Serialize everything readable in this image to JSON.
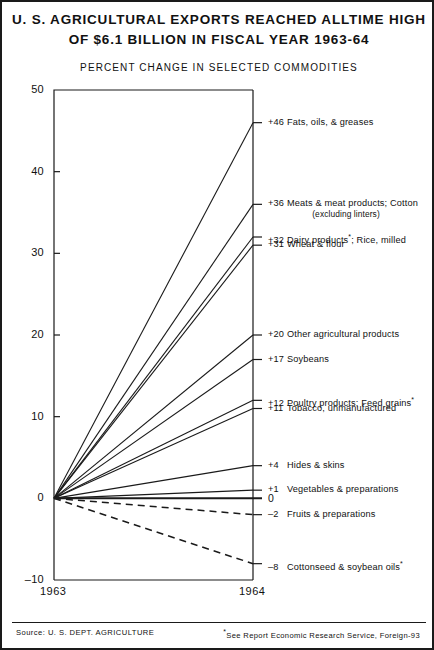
{
  "title": {
    "line1": "U. S. AGRICULTURAL EXPORTS REACHED ALLTIME HIGH",
    "line2": "OF $6.1 BILLION IN FISCAL YEAR 1963-64"
  },
  "subtitle": "PERCENT CHANGE IN SELECTED COMMODITIES",
  "footer": {
    "source": "Source: U. S. DEPT. AGRICULTURE",
    "note_star": "*",
    "note": "See Report Economic Research Service, Foreign-93"
  },
  "axis": {
    "y_ticks": [
      "50",
      "40",
      "30",
      "20",
      "10",
      "0",
      "-10"
    ],
    "x_ticks": [
      "1963",
      "1964"
    ],
    "zero_marker": "0"
  },
  "chart_data": {
    "type": "line",
    "title": "U. S. AGRICULTURAL EXPORTS REACHED ALLTIME HIGH OF $6.1 BILLION IN FISCAL YEAR 1963-64",
    "subtitle": "PERCENT CHANGE IN SELECTED COMMODITIES",
    "xlabel": "",
    "ylabel": "",
    "x": [
      "1963",
      "1964"
    ],
    "ylim": [
      -10,
      50
    ],
    "yticks": [
      -10,
      0,
      10,
      20,
      30,
      40,
      50
    ],
    "grid": false,
    "legend": "right-inline-labels",
    "series": [
      {
        "name": "Fats, oils, & greases",
        "value_label": "+46",
        "values": [
          0,
          46
        ],
        "style": "solid",
        "label": "Fats, oils, & greases",
        "footnote": false
      },
      {
        "name": "Meats & meat products; Cotton (excluding linters)",
        "value_label": "+36",
        "values": [
          0,
          36
        ],
        "style": "solid",
        "label": "Meats & meat products; Cotton",
        "sublabel": "(excluding linters)",
        "footnote": false
      },
      {
        "name": "Dairy products*; Rice, milled",
        "value_label": "+32",
        "values": [
          0,
          32
        ],
        "style": "solid",
        "label_pre": "Dairy products",
        "label_post": "; Rice, milled",
        "footnote": true
      },
      {
        "name": "Wheat & flour",
        "value_label": "+31",
        "values": [
          0,
          31
        ],
        "style": "solid",
        "label": "Wheat & flour",
        "footnote": false
      },
      {
        "name": "Other agricultural products",
        "value_label": "+20",
        "values": [
          0,
          20
        ],
        "style": "solid",
        "label": "Other agricultural products",
        "footnote": false
      },
      {
        "name": "Soybeans",
        "value_label": "+17",
        "values": [
          0,
          17
        ],
        "style": "solid",
        "label": "Soybeans",
        "footnote": false
      },
      {
        "name": "Poultry products; Feed grains*",
        "value_label": "+12",
        "values": [
          0,
          12
        ],
        "style": "solid",
        "label_pre": "Poultry products; Feed grains",
        "label_post": "",
        "footnote": true
      },
      {
        "name": "Tobacco, unmanufactured",
        "value_label": "+11",
        "values": [
          0,
          11
        ],
        "style": "solid",
        "label": "Tobacco, unmanufactured",
        "footnote": false
      },
      {
        "name": "Hides & skins",
        "value_label": "+4",
        "values": [
          0,
          4
        ],
        "style": "solid",
        "label": "Hides & skins",
        "footnote": false
      },
      {
        "name": "Vegetables & preparations",
        "value_label": "+1",
        "values": [
          0,
          1
        ],
        "style": "solid",
        "label": "Vegetables & preparations",
        "footnote": false
      },
      {
        "name": "Fruits & preparations",
        "value_label": "-2",
        "values": [
          0,
          -2
        ],
        "style": "dashed",
        "label": "Fruits & preparations",
        "footnote": false
      },
      {
        "name": "Cottonseed & soybean oils*",
        "value_label": "-8",
        "values": [
          0,
          -8
        ],
        "style": "dashed",
        "label_pre": "Cottonseed & soybean oils",
        "label_post": "",
        "footnote": true
      }
    ]
  }
}
